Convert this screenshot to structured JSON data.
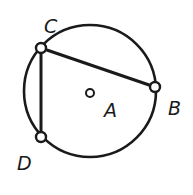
{
  "diagram": {
    "type": "circle-geometry",
    "stroke_color": "#1a1a1a",
    "background": "#ffffff",
    "circle": {
      "center_label": "A",
      "cx": 90,
      "cy": 91,
      "r": 66
    },
    "points": [
      {
        "label": "C",
        "x": 41,
        "y": 48,
        "label_x": 44,
        "label_y": 33
      },
      {
        "label": "B",
        "x": 155,
        "y": 87,
        "label_x": 168,
        "label_y": 115
      },
      {
        "label": "D",
        "x": 41,
        "y": 137,
        "label_x": 17,
        "label_y": 170
      },
      {
        "label": "A",
        "x": 90,
        "y": 93,
        "label_x": 104,
        "label_y": 117
      }
    ],
    "segments": [
      {
        "from": "C",
        "to": "B"
      },
      {
        "from": "C",
        "to": "D"
      }
    ]
  }
}
